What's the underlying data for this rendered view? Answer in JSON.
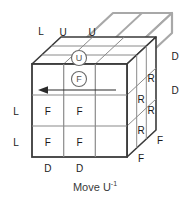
{
  "diagram": {
    "caption": {
      "text": "Move U",
      "exponent": "-1"
    },
    "background_color": "#ffffff",
    "colors": {
      "outline": "#3a3a3a",
      "grid": "#8a8a8a",
      "highlight": "#a8a8a8",
      "text": "#1a1a1a",
      "caption": "#3a3a3a",
      "circle_marker": "#6a6a6a",
      "arrow": "#2a2a2a"
    },
    "faces": {
      "front": {
        "name": "Front face",
        "cells": [
          {
            "row": 0,
            "col": 0,
            "label": ""
          },
          {
            "row": 0,
            "col": 1,
            "label": ""
          },
          {
            "row": 0,
            "col": 2,
            "label": ""
          },
          {
            "row": 1,
            "col": 0,
            "label": "F"
          },
          {
            "row": 1,
            "col": 1,
            "label": "F"
          },
          {
            "row": 1,
            "col": 2,
            "label": ""
          },
          {
            "row": 2,
            "col": 0,
            "label": "F"
          },
          {
            "row": 2,
            "col": 1,
            "label": "F"
          },
          {
            "row": 2,
            "col": 2,
            "label": ""
          }
        ]
      },
      "top": {
        "name": "Top face",
        "cells": [
          {
            "row": 0,
            "col": 0,
            "label": "U"
          },
          {
            "row": 0,
            "col": 1,
            "label": "U"
          }
        ]
      },
      "right": {
        "name": "Right face",
        "cells": [
          {
            "label": "R"
          },
          {
            "label": "R"
          },
          {
            "label": "R"
          },
          {
            "label": "R"
          }
        ]
      }
    },
    "edge_labels": {
      "left": [
        "L",
        "L",
        "L"
      ],
      "right": [
        "D",
        "D"
      ],
      "bottom": [
        "D",
        "D"
      ],
      "bottom_right": [
        "F",
        "F"
      ]
    },
    "markers": {
      "top_circle": "U",
      "front_circle": "F"
    },
    "arrow": {
      "name": "rotation-arrow",
      "direction": "left",
      "description": "Leftward horizontal arrow across the top row of the front face"
    }
  }
}
